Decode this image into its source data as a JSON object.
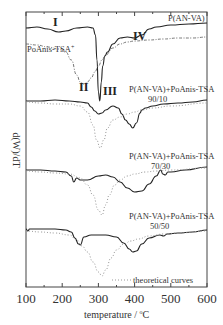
{
  "chart_data": {
    "type": "line",
    "title": "",
    "xlabel": "temperature / °C",
    "ylabel": "d(W)/dT",
    "xlim": [
      100,
      600
    ],
    "xticks": [
      100,
      200,
      300,
      400,
      500,
      600
    ],
    "xtick_labels": [
      "100",
      "200",
      "300",
      "400",
      "500",
      "600"
    ],
    "grid": false,
    "yticks_shown": false,
    "series": [
      {
        "name": "P(AN-VA)",
        "style": "solid",
        "label_pos": [
          600,
          "top-right"
        ],
        "x": [
          100,
          130,
          160,
          190,
          210,
          240,
          270,
          285,
          292,
          296,
          300,
          304,
          308,
          312,
          318,
          325,
          340,
          360,
          380,
          400,
          420,
          440,
          460,
          500,
          550,
          600
        ],
        "y_px": [
          28,
          27,
          29,
          32,
          31,
          28,
          27,
          28,
          35,
          60,
          92,
          101,
          82,
          66,
          56,
          52,
          44,
          38,
          37,
          38,
          35,
          29,
          27,
          25,
          24,
          23
        ]
      },
      {
        "name": "PoAnis-TSA+",
        "style": "dash-dot",
        "x": [
          100,
          130,
          160,
          190,
          210,
          225,
          240,
          250,
          260,
          270,
          280,
          290,
          300,
          310,
          320,
          340,
          360,
          380,
          400,
          440,
          480,
          520,
          560,
          600
        ],
        "y_px": [
          44,
          45,
          47,
          49,
          52,
          60,
          75,
          82,
          84,
          82,
          78,
          72,
          66,
          60,
          55,
          48,
          44,
          42,
          41,
          40,
          39,
          38,
          38,
          37
        ]
      },
      {
        "name": "P(AN-VA)+PoAnis-TSA 90/10",
        "style": "solid",
        "label": "P(AN-VA)+PoAnis-TSA",
        "ratio": "90/10",
        "x": [
          100,
          140,
          180,
          220,
          250,
          270,
          280,
          290,
          300,
          310,
          320,
          340,
          355,
          365,
          375,
          385,
          395,
          405,
          415,
          420,
          430,
          450,
          480,
          520,
          560,
          600
        ],
        "y_px": [
          101,
          101,
          100,
          101,
          102,
          103,
          107,
          111,
          114,
          113,
          110,
          106,
          108,
          114,
          120,
          124,
          128,
          123,
          113,
          110,
          108,
          106,
          104,
          103,
          102,
          100
        ]
      },
      {
        "name": "theoretical 90/10",
        "style": "dotted",
        "x": [
          100,
          140,
          180,
          220,
          250,
          270,
          285,
          295,
          305,
          315,
          325,
          340,
          360,
          380,
          400,
          420,
          450,
          500,
          600
        ],
        "y_px": [
          102,
          103,
          104,
          104,
          106,
          112,
          125,
          140,
          148,
          140,
          128,
          120,
          117,
          114,
          112,
          110,
          108,
          106,
          103
        ]
      },
      {
        "name": "P(AN-VA)+PoAnis-TSA 70/30",
        "style": "solid",
        "label": "P(AN-VA)+PoAnis-TSA",
        "ratio": "70/30",
        "x": [
          100,
          140,
          180,
          210,
          225,
          232,
          240,
          250,
          270,
          300,
          320,
          340,
          360,
          380,
          400,
          420,
          440,
          460,
          472,
          478,
          485,
          492,
          500,
          540,
          600
        ],
        "y_px": [
          170,
          170,
          171,
          172,
          176,
          182,
          178,
          180,
          180,
          176,
          175,
          177,
          182,
          188,
          192,
          191,
          184,
          176,
          170,
          174,
          175,
          172,
          172,
          170,
          167
        ]
      },
      {
        "name": "theoretical 70/30",
        "style": "dotted",
        "x": [
          100,
          140,
          180,
          220,
          250,
          270,
          285,
          300,
          310,
          320,
          330,
          345,
          360,
          380,
          400,
          430,
          460,
          500,
          600
        ],
        "y_px": [
          171,
          172,
          173,
          174,
          178,
          185,
          195,
          210,
          215,
          205,
          195,
          185,
          180,
          176,
          174,
          172,
          171,
          170,
          168
        ]
      },
      {
        "name": "P(AN-VA)+PoAnis-TSA 50/50",
        "style": "solid",
        "label": "P(AN-VA)+PoAnis-TSA",
        "ratio": "50/50",
        "x": [
          100,
          105,
          110,
          140,
          180,
          210,
          225,
          235,
          245,
          250,
          260,
          280,
          320,
          350,
          370,
          385,
          395,
          405,
          420,
          440,
          470,
          480,
          490,
          520,
          560,
          600
        ],
        "y_px": [
          229,
          231,
          229,
          229,
          229,
          230,
          232,
          238,
          244,
          245,
          237,
          235,
          235,
          237,
          243,
          249,
          252,
          251,
          244,
          238,
          235,
          236,
          234,
          233,
          232,
          230
        ]
      },
      {
        "name": "theoretical 50/50",
        "style": "dotted",
        "x": [
          100,
          140,
          180,
          220,
          240,
          255,
          270,
          285,
          300,
          310,
          320,
          335,
          350,
          370,
          390,
          410,
          440,
          480,
          520,
          600
        ],
        "y_px": [
          231,
          232,
          233,
          235,
          240,
          246,
          252,
          262,
          272,
          276,
          270,
          258,
          250,
          244,
          241,
          239,
          236,
          234,
          233,
          231
        ]
      }
    ],
    "annotations": [
      {
        "text": "I",
        "near_x": 190
      },
      {
        "text": "II",
        "near_x": 262
      },
      {
        "text": "III",
        "near_x": 322
      },
      {
        "text": "IV",
        "near_x": 410
      },
      {
        "text": "PoAnis-TSA+",
        "near_x": 100
      },
      {
        "text": "theoretical curves",
        "legend_style": "dotted"
      }
    ]
  },
  "labels": {
    "pan_va": "P(AN-VA)",
    "poanis": "PoAnis-TSA",
    "poanis_sup": "+",
    "blend": "P(AN-VA)+PoAnis-TSA",
    "r90": "90/10",
    "r70": "70/30",
    "r50": "50/50",
    "legend_theoretical": "theoretical curves",
    "roman_I": "I",
    "roman_II": "II",
    "roman_III": "III",
    "roman_IV": "IV",
    "xlabel_main": "temperature / ",
    "xlabel_unit_deg": "o",
    "xlabel_unit": "C",
    "ylabel": "d(W)/dT"
  }
}
